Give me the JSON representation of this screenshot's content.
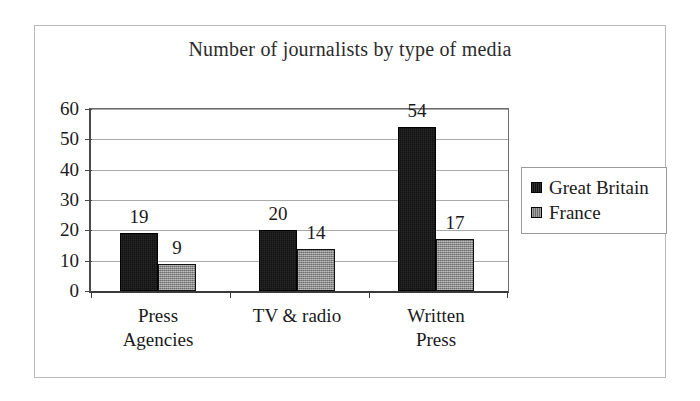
{
  "chart_data": {
    "type": "bar",
    "title": "Number of journalists by type of media",
    "xlabel": "",
    "ylabel": "",
    "categories": [
      "Press\nAgencies",
      "TV & radio",
      "Written Press"
    ],
    "series": [
      {
        "name": "Great Britain",
        "color": "#111111",
        "values": [
          19,
          20,
          54
        ]
      },
      {
        "name": "France",
        "color": "#808080",
        "values": [
          9,
          14,
          17
        ]
      }
    ],
    "ylim": [
      0,
      60
    ],
    "ytick_values": [
      60,
      50,
      40,
      30,
      20,
      10,
      0
    ],
    "ytick_labels": [
      "60",
      "50",
      "40",
      "30",
      "20",
      "10",
      "0"
    ],
    "grid": true,
    "grid_axis": "y",
    "legend_position": "right",
    "data_labels": true
  },
  "legend": {
    "items": [
      {
        "label": "Great Britain",
        "swatch": "legend-swatch-great-britain"
      },
      {
        "label": "France",
        "swatch": "legend-swatch-france"
      }
    ]
  }
}
